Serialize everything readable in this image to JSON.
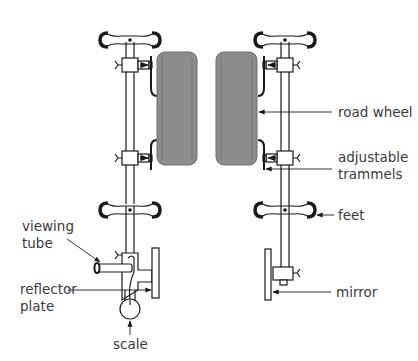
{
  "diagram": {
    "labels": {
      "road_wheel": "road wheel",
      "adjustable_line1": "adjustable",
      "adjustable_line2": "trammels",
      "feet": "feet",
      "mirror": "mirror",
      "viewing_line1": "viewing",
      "viewing_line2": "tube",
      "reflector_line1": "reflector",
      "reflector_line2": "plate",
      "scale": "scale"
    },
    "colors": {
      "line": "#1a1a1a",
      "wheel_fill": "#8c8c8c",
      "wheel_edge": "#6e6e6e",
      "text": "#3a3a3a"
    }
  }
}
